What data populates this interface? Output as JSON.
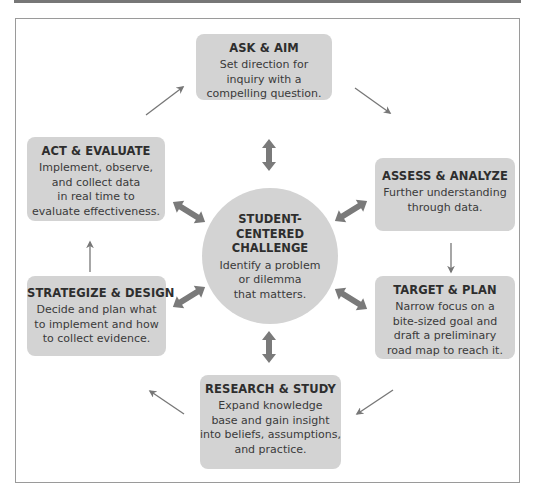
{
  "diagram": {
    "center": {
      "title": "STUDENT-\nCENTERED\nCHALLENGE",
      "desc": "Identify a problem\nor dilemma\nthat matters."
    },
    "steps": [
      {
        "id": "ask-aim",
        "title": "ASK & AIM",
        "desc": "Set direction for\ninquiry with a\ncompelling question."
      },
      {
        "id": "assess-analyze",
        "title": "ASSESS & ANALYZE",
        "desc": "Further understanding\nthrough data."
      },
      {
        "id": "target-plan",
        "title": "TARGET & PLAN",
        "desc": "Narrow focus on a\nbite-sized goal and\ndraft a preliminary\nroad map to reach it."
      },
      {
        "id": "research-study",
        "title": "RESEARCH & STUDY",
        "desc": "Expand knowledge\nbase and gain insight\ninto beliefs, assumptions,\nand practice."
      },
      {
        "id": "strategize-design",
        "title": "STRATEGIZE & DESIGN",
        "desc": "Decide and plan what\nto implement and how\nto collect evidence."
      },
      {
        "id": "act-evaluate",
        "title": "ACT & EVALUATE",
        "desc": "Implement, observe,\nand collect data\nin real time to\nevaluate effectiveness."
      }
    ],
    "colors": {
      "box_fill": "#d3d3d3",
      "arrow": "#777777",
      "frame": "#9a9a9a"
    }
  }
}
